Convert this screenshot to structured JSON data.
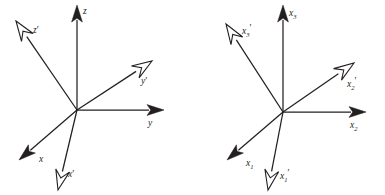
{
  "figure": {
    "type": "vector-axes-diagram",
    "background_color": "#ffffff",
    "ink_color": "#231f20",
    "panels": [
      {
        "name": "left-panel",
        "origin": {
          "x": 77,
          "y": 110
        },
        "axes": [
          {
            "name": "z-axis",
            "label": "z",
            "label_plain": "z",
            "arrowhead": "solid",
            "tip": {
              "x": 77,
              "y": 5
            },
            "label_pos": {
              "x": 83,
              "y": 14
            }
          },
          {
            "name": "y-axis",
            "label": "y",
            "label_plain": "y",
            "arrowhead": "solid",
            "tip": {
              "x": 164,
              "y": 110
            },
            "label_pos": {
              "x": 148,
              "y": 126
            }
          },
          {
            "name": "x-axis",
            "label": "x",
            "label_plain": "x",
            "arrowhead": "solid",
            "tip": {
              "x": 19,
              "y": 160
            },
            "label_pos": {
              "x": 39,
              "y": 162
            }
          },
          {
            "name": "z-prime-axis",
            "label": "z′",
            "label_plain": "z'",
            "arrowhead": "hollow",
            "tip": {
              "x": 16,
              "y": 21
            },
            "label_pos": {
              "x": 33,
              "y": 33
            }
          },
          {
            "name": "y-prime-axis",
            "label": "y′",
            "label_plain": "y'",
            "arrowhead": "hollow",
            "tip": {
              "x": 152,
              "y": 61
            },
            "label_pos": {
              "x": 141,
              "y": 84
            }
          },
          {
            "name": "x-prime-axis",
            "label": "x′",
            "label_plain": "x'",
            "arrowhead": "hollow",
            "tip": {
              "x": 58,
              "y": 190
            },
            "label_pos": {
              "x": 68,
              "y": 177
            }
          }
        ]
      },
      {
        "name": "right-panel",
        "origin": {
          "x": 283,
          "y": 112
        },
        "axes": [
          {
            "name": "x3-axis",
            "label_base": "x",
            "label_sub": "3",
            "label_prime": "",
            "arrowhead": "solid",
            "tip": {
              "x": 283,
              "y": 5
            },
            "label_pos": {
              "x": 289,
              "y": 16
            }
          },
          {
            "name": "x2-axis",
            "label_base": "x",
            "label_sub": "2",
            "label_prime": "",
            "arrowhead": "solid",
            "tip": {
              "x": 366,
              "y": 112
            },
            "label_pos": {
              "x": 350,
              "y": 128
            }
          },
          {
            "name": "x1-axis",
            "label_base": "x",
            "label_sub": "1",
            "label_prime": "",
            "arrowhead": "solid",
            "tip": {
              "x": 227,
              "y": 160
            },
            "label_pos": {
              "x": 246,
              "y": 166
            }
          },
          {
            "name": "x3-prime-axis",
            "label_base": "x",
            "label_sub": "3",
            "label_prime": "′",
            "arrowhead": "hollow",
            "tip": {
              "x": 226,
              "y": 24
            },
            "label_pos": {
              "x": 242,
              "y": 34
            }
          },
          {
            "name": "x2-prime-axis",
            "label_base": "x",
            "label_sub": "2",
            "label_prime": "′",
            "arrowhead": "hollow",
            "tip": {
              "x": 354,
              "y": 63
            },
            "label_pos": {
              "x": 347,
              "y": 87
            }
          },
          {
            "name": "x1-prime-axis",
            "label_base": "x",
            "label_sub": "1",
            "label_prime": "′",
            "arrowhead": "hollow",
            "tip": {
              "x": 268,
              "y": 190
            },
            "label_pos": {
              "x": 280,
              "y": 179
            }
          }
        ]
      }
    ]
  }
}
